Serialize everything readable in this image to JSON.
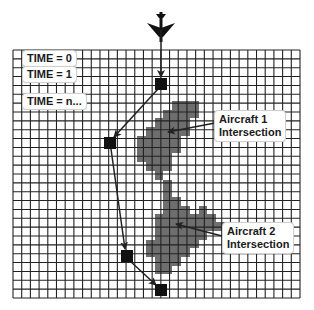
{
  "diagram": {
    "colors": {
      "grid_line": "#222222",
      "shaded": "#6e6e6e",
      "marker": "#111111",
      "path": "#222222",
      "background": "#ffffff"
    },
    "icon": "airplane-icon",
    "time_labels": [
      {
        "text": "TIME = 0"
      },
      {
        "text": "TIME = 1"
      },
      {
        "text": "TIME = n..."
      }
    ],
    "annotations": [
      {
        "line1": "Aircraft 1",
        "line2": "Intersection"
      },
      {
        "line1": "Aircraft 2",
        "line2": "Intersection"
      }
    ],
    "grid": {
      "cols": 33,
      "rows": 28
    },
    "waypoints": [
      {
        "x": 161,
        "y": 84
      },
      {
        "x": 110,
        "y": 143
      },
      {
        "x": 127,
        "y": 256
      },
      {
        "x": 161,
        "y": 290
      }
    ]
  }
}
